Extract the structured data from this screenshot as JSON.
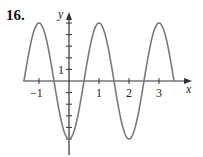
{
  "problem_number": "16.",
  "chart_data": {
    "type": "line",
    "title": "",
    "xlabel": "x",
    "ylabel": "y",
    "function_estimate": "y = -5 cos(pi x)",
    "xlim": [
      -1.5,
      3.5
    ],
    "ylim": [
      -5,
      5
    ],
    "x_tick_labels": [
      "-1",
      "1",
      "2",
      "3"
    ],
    "y_tick_labels": [
      "1"
    ],
    "y_ticks": [
      -5,
      -4,
      -3,
      -2,
      -1,
      1,
      2,
      3,
      4,
      5
    ],
    "grid": false,
    "series": [
      {
        "name": "curve",
        "color": "#777777",
        "x": [
          -1.5,
          -1,
          -0.5,
          0,
          0.5,
          1,
          1.5,
          2,
          2.5,
          3,
          3.5
        ],
        "y": [
          0,
          5,
          0,
          -5,
          0,
          5,
          0,
          -5,
          0,
          5,
          0
        ]
      }
    ]
  },
  "labels": {
    "x_axis": "x",
    "y_axis": "y",
    "xt_m1": "−1",
    "xt_1": "1",
    "xt_2": "2",
    "xt_3": "3",
    "yt_1": "1"
  }
}
